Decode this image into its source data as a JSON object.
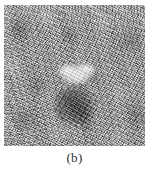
{
  "figure": {
    "caption": "(b)",
    "panel_label": "b",
    "image_kind": "grayscale-speckle-noise-image",
    "background_gray_hex": "#a2a2a2",
    "regions": [
      {
        "name": "bright-blob",
        "description": "bright elongated high-intensity region",
        "tone": "bright",
        "color_hex": "#ffffff"
      },
      {
        "name": "dark-blob",
        "description": "dark rounded low-intensity region below the bright region",
        "tone": "dark",
        "color_hex": "#5e5e5e"
      }
    ]
  }
}
